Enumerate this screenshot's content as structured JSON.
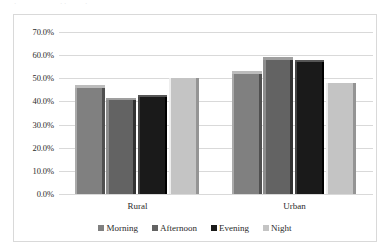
{
  "top_artifacts": [
    "·",
    "· ·",
    "·"
  ],
  "chart_data": {
    "type": "bar",
    "title": "",
    "subtitle": "",
    "xlabel": "",
    "ylabel": "",
    "categories": [
      "Rural",
      "Urban"
    ],
    "series": [
      {
        "name": "Morning",
        "values": [
          47.0,
          53.0
        ],
        "color": "#808080"
      },
      {
        "name": "Afternoon",
        "values": [
          41.5,
          59.0
        ],
        "color": "#636363"
      },
      {
        "name": "Evening",
        "values": [
          43.0,
          58.0
        ],
        "color": "#1a1a1a"
      },
      {
        "name": "Night",
        "values": [
          51.0,
          49.0
        ],
        "color": "#c4c4c4"
      }
    ],
    "ylim": [
      0,
      70
    ],
    "ytick_values": [
      0,
      10,
      20,
      30,
      40,
      50,
      60,
      70
    ],
    "ytick_labels": [
      "0.0%",
      "10.0%",
      "20.0%",
      "30.0%",
      "40.0%",
      "50.0%",
      "60.0%",
      "70.0%"
    ],
    "grid": true,
    "grid_color": "#d9d9d9",
    "legend_position": "bottom",
    "border_color": "#d9d9d9",
    "background": "#ffffff",
    "bar_style": "3d-bevel"
  }
}
